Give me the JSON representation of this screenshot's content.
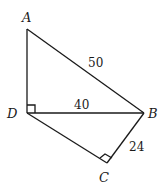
{
  "diagram": {
    "points": {
      "A": {
        "label": "A",
        "x": 27,
        "y": 29
      },
      "D": {
        "label": "D",
        "x": 27,
        "y": 113
      },
      "B": {
        "label": "B",
        "x": 144,
        "y": 113
      },
      "C": {
        "label": "C",
        "x": 107,
        "y": 163
      }
    },
    "edges": [
      {
        "from": "A",
        "to": "D"
      },
      {
        "from": "A",
        "to": "B",
        "length_label": "50"
      },
      {
        "from": "D",
        "to": "B",
        "length_label": "40"
      },
      {
        "from": "D",
        "to": "C"
      },
      {
        "from": "C",
        "to": "B",
        "length_label": "24"
      }
    ],
    "right_angles": [
      "D",
      "C"
    ],
    "labels": {
      "A": "A",
      "B": "B",
      "C": "C",
      "D": "D",
      "AB": "50",
      "DB": "40",
      "CB": "24"
    }
  }
}
